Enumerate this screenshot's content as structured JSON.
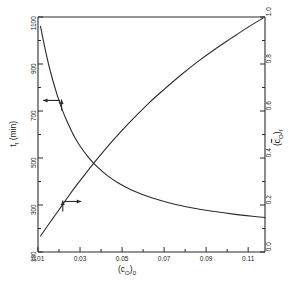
{
  "figure": {
    "background_color": "#ffffff",
    "line_color": "#2b2b2b"
  },
  "chart_data": {
    "type": "line",
    "title": "",
    "subtitle": "",
    "xlabel": "(c_O)_0",
    "xlabel_parts": {
      "open": "(c",
      "sub1": "O",
      "close": ")",
      "sub2": "0"
    },
    "ylabel_left": "t_f (min)",
    "ylabel_left_parts": {
      "main": "t",
      "sub": "f",
      "units": "(min)"
    },
    "ylabel_right": "(c̄_O)_f",
    "ylabel_right_parts": {
      "open": "(",
      "bar_char": "c",
      "sub1": "O",
      "close": ")",
      "sub2": "f"
    },
    "grid": false,
    "legend": false,
    "legend_position": "none",
    "xlim": [
      0.01,
      0.118
    ],
    "xticks": [
      0.01,
      0.03,
      0.05,
      0.07,
      0.09,
      0.11
    ],
    "xtick_labels": [
      "0.01",
      "0.03",
      "0.05",
      "0.07",
      "0.09",
      "0.11"
    ],
    "xminor_ticks": [
      0.02,
      0.04,
      0.06,
      0.08,
      0.1
    ],
    "ylim_left": [
      100,
      1100
    ],
    "yticks_left": [
      100,
      300,
      500,
      700,
      900,
      1100
    ],
    "ytick_labels_left": [
      "100",
      "300",
      "500",
      "700",
      "900",
      "1100"
    ],
    "yminor_ticks_left": [
      200,
      400,
      600,
      800,
      1000
    ],
    "ylim_right": [
      0.0,
      1.0
    ],
    "yticks_right": [
      0.0,
      0.2,
      0.4,
      0.6,
      0.8,
      1.0
    ],
    "ytick_labels_right": [
      "0.0",
      "0.2",
      "0.4",
      "0.6",
      "0.8",
      "1.0"
    ],
    "yminor_ticks_right": [
      0.1,
      0.3,
      0.5,
      0.7,
      0.9
    ],
    "series": [
      {
        "name": "t_f",
        "axis": "left",
        "annotation": "arrow-left",
        "x": [
          0.0112,
          0.013,
          0.015,
          0.017,
          0.019,
          0.0215,
          0.024,
          0.027,
          0.03,
          0.034,
          0.038,
          0.043,
          0.048,
          0.054,
          0.06,
          0.068,
          0.076,
          0.085,
          0.094,
          0.103,
          0.112,
          0.118
        ],
        "y": [
          1060,
          980,
          900,
          832,
          772,
          706,
          652,
          596,
          551,
          503,
          464,
          425,
          395,
          366,
          344,
          320,
          301,
          285,
          272,
          261,
          252,
          247
        ]
      },
      {
        "name": "c_O_f",
        "axis": "right",
        "annotation": "arrow-right",
        "x": [
          0.0112,
          0.014,
          0.017,
          0.02,
          0.024,
          0.028,
          0.033,
          0.038,
          0.044,
          0.05,
          0.056,
          0.063,
          0.07,
          0.078,
          0.086,
          0.094,
          0.102,
          0.11,
          0.117
        ],
        "y": [
          0.068,
          0.104,
          0.142,
          0.18,
          0.231,
          0.28,
          0.338,
          0.394,
          0.458,
          0.518,
          0.574,
          0.636,
          0.692,
          0.753,
          0.81,
          0.862,
          0.91,
          0.957,
          0.995
        ]
      }
    ],
    "annotations": [
      {
        "name": "left-axis-pointer",
        "kind": "arrow",
        "direction": "left",
        "x_data": 0.0205,
        "y_left": 745
      },
      {
        "name": "right-axis-pointer",
        "kind": "arrow",
        "direction": "right",
        "x_data": 0.0225,
        "y_right": 0.215
      }
    ]
  }
}
